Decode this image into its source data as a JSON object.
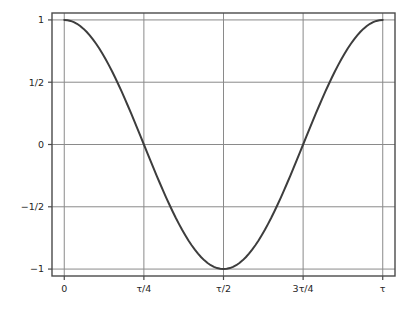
{
  "chart_data": {
    "type": "line",
    "title": "",
    "xlabel": "",
    "ylabel": "",
    "x_tick_labels": [
      "0",
      "τ/4",
      "τ/2",
      "3τ/4",
      "τ"
    ],
    "x_tick_values": [
      0,
      0.25,
      0.5,
      0.75,
      1
    ],
    "y_tick_labels": [
      "1",
      "1/2",
      "0",
      "−1/2",
      "−1"
    ],
    "y_tick_values": [
      1,
      0.5,
      0,
      -0.5,
      -1
    ],
    "xlim": [
      -0.0385,
      1.0385
    ],
    "ylim": [
      -1.0556,
      1.0556
    ],
    "grid": true,
    "legend": null,
    "series": [
      {
        "name": "cos(τx)",
        "color": "#3d3d3d",
        "linewidth": 2,
        "x": [
          0,
          0.01,
          0.02,
          0.03,
          0.04,
          0.05,
          0.06,
          0.07,
          0.08,
          0.09,
          0.1,
          0.11,
          0.12,
          0.13,
          0.14,
          0.15,
          0.16,
          0.17,
          0.18,
          0.19,
          0.2,
          0.21,
          0.22,
          0.23,
          0.24,
          0.25,
          0.26,
          0.27,
          0.28,
          0.29,
          0.3,
          0.31,
          0.32,
          0.33,
          0.34,
          0.35,
          0.36,
          0.37,
          0.38,
          0.39,
          0.4,
          0.41,
          0.42,
          0.43,
          0.44,
          0.45,
          0.46,
          0.47,
          0.48,
          0.49,
          0.5,
          0.51,
          0.52,
          0.53,
          0.54,
          0.55,
          0.56,
          0.57,
          0.58,
          0.59,
          0.6,
          0.61,
          0.62,
          0.63,
          0.64,
          0.65,
          0.66,
          0.67,
          0.68,
          0.69,
          0.7,
          0.71,
          0.72,
          0.73,
          0.74,
          0.75,
          0.76,
          0.77,
          0.78,
          0.79,
          0.8,
          0.81,
          0.82,
          0.83,
          0.84,
          0.85,
          0.86,
          0.87,
          0.88,
          0.89,
          0.9,
          0.91,
          0.92,
          0.93,
          0.94,
          0.95,
          0.96,
          0.97,
          0.98,
          0.99,
          1
        ],
        "y": [
          1.0,
          0.998,
          0.992,
          0.982,
          0.969,
          0.951,
          0.93,
          0.905,
          0.876,
          0.844,
          0.809,
          0.771,
          0.729,
          0.685,
          0.637,
          0.588,
          0.536,
          0.482,
          0.426,
          0.368,
          0.309,
          0.249,
          0.187,
          0.125,
          0.063,
          0.0,
          -0.063,
          -0.125,
          -0.187,
          -0.249,
          -0.309,
          -0.368,
          -0.426,
          -0.482,
          -0.536,
          -0.588,
          -0.637,
          -0.685,
          -0.729,
          -0.771,
          -0.809,
          -0.844,
          -0.876,
          -0.905,
          -0.93,
          -0.951,
          -0.969,
          -0.982,
          -0.992,
          -0.998,
          -1.0,
          -0.998,
          -0.992,
          -0.982,
          -0.969,
          -0.951,
          -0.93,
          -0.905,
          -0.876,
          -0.844,
          -0.809,
          -0.771,
          -0.729,
          -0.685,
          -0.637,
          -0.588,
          -0.536,
          -0.482,
          -0.426,
          -0.368,
          -0.309,
          -0.249,
          -0.187,
          -0.125,
          -0.063,
          0.0,
          0.063,
          0.125,
          0.187,
          0.249,
          0.309,
          0.368,
          0.426,
          0.482,
          0.536,
          0.588,
          0.637,
          0.685,
          0.729,
          0.771,
          0.809,
          0.844,
          0.876,
          0.905,
          0.93,
          0.951,
          0.969,
          0.982,
          0.992,
          0.998,
          1.0
        ]
      }
    ],
    "colors": {
      "curve": "#3d3d3d",
      "grid": "#8a8a8a",
      "axes_frame": "#4a4a4a",
      "tick_label": "#262626",
      "background": "#ffffff"
    }
  }
}
